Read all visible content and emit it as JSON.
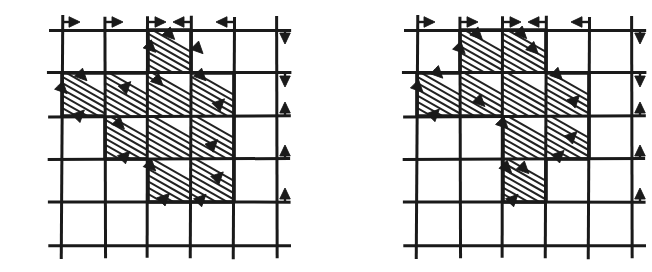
{
  "figure": {
    "type": "grid-diagram-pair",
    "background_color": "#ffffff",
    "ink_color": "#1a1a1a",
    "hatch_color": "#222222",
    "hatch_angle_deg": 45
  },
  "grid": {
    "columns": 5,
    "rows": 5,
    "cell_size": 43,
    "line_width_major": 3,
    "line_width_hatch": 2,
    "overhang": 14
  },
  "diagrams": [
    {
      "id": "left-diagram",
      "name": "left-grid-diagram",
      "origin_x": 62,
      "origin_y": 30,
      "shaded_cells": [
        {
          "row": 1,
          "col": 3
        },
        {
          "row": 2,
          "col": 1
        },
        {
          "row": 2,
          "col": 2
        },
        {
          "row": 2,
          "col": 3
        },
        {
          "row": 2,
          "col": 4
        },
        {
          "row": 3,
          "col": 2
        },
        {
          "row": 3,
          "col": 3
        },
        {
          "row": 3,
          "col": 4
        },
        {
          "row": 4,
          "col": 3
        },
        {
          "row": 4,
          "col": 4
        }
      ],
      "top_arrows": [
        {
          "index": 1,
          "direction": "right",
          "glyph": "→"
        },
        {
          "index": 2,
          "direction": "right",
          "glyph": "→"
        },
        {
          "index": 3,
          "direction": "right",
          "glyph": "→"
        },
        {
          "index": 4,
          "direction": "left",
          "glyph": "←"
        },
        {
          "index": 5,
          "direction": "left",
          "glyph": "←"
        }
      ],
      "right_arrows": [
        {
          "index": 1,
          "direction": "down",
          "glyph": "↓"
        },
        {
          "index": 2,
          "direction": "down",
          "glyph": "↓"
        },
        {
          "index": 3,
          "direction": "up",
          "glyph": "↑"
        },
        {
          "index": 4,
          "direction": "up",
          "glyph": "↑"
        },
        {
          "index": 5,
          "direction": "up",
          "glyph": "↑"
        }
      ],
      "interior_arrows": [
        {
          "row": 1,
          "col": 3,
          "direction": "down-right",
          "x_frac": 0.18,
          "y_frac": 0.52
        },
        {
          "row": 1,
          "col": 3,
          "direction": "down-right",
          "x_frac": 0.62,
          "y_frac": 0.22
        },
        {
          "row": 1,
          "col": 4,
          "direction": "down-right",
          "x_frac": 0.28,
          "y_frac": 0.55
        },
        {
          "row": 2,
          "col": 1,
          "direction": "down-right",
          "x_frac": 0.58,
          "y_frac": 0.18
        },
        {
          "row": 2,
          "col": 1,
          "direction": "down-right",
          "x_frac": 0.12,
          "y_frac": 0.48
        },
        {
          "row": 2,
          "col": 1,
          "direction": "up-right",
          "x_frac": 0.52,
          "y_frac": 0.86
        },
        {
          "row": 2,
          "col": 2,
          "direction": "up-right",
          "x_frac": 0.6,
          "y_frac": 0.2
        },
        {
          "row": 2,
          "col": 3,
          "direction": "down-right",
          "x_frac": 0.35,
          "y_frac": 0.3
        },
        {
          "row": 2,
          "col": 4,
          "direction": "down-right",
          "x_frac": 0.35,
          "y_frac": 0.18
        },
        {
          "row": 2,
          "col": 4,
          "direction": "up-right",
          "x_frac": 0.78,
          "y_frac": 0.6
        },
        {
          "row": 3,
          "col": 2,
          "direction": "down-right",
          "x_frac": 0.45,
          "y_frac": 0.3
        },
        {
          "row": 3,
          "col": 2,
          "direction": "up-right",
          "x_frac": 0.58,
          "y_frac": 0.82
        },
        {
          "row": 3,
          "col": 4,
          "direction": "up-right",
          "x_frac": 0.62,
          "y_frac": 0.55
        },
        {
          "row": 4,
          "col": 3,
          "direction": "down-right",
          "x_frac": 0.18,
          "y_frac": 0.28
        },
        {
          "row": 4,
          "col": 3,
          "direction": "up-right",
          "x_frac": 0.5,
          "y_frac": 0.8
        },
        {
          "row": 4,
          "col": 4,
          "direction": "up-right",
          "x_frac": 0.35,
          "y_frac": 0.82
        },
        {
          "row": 4,
          "col": 4,
          "direction": "up-right",
          "x_frac": 0.75,
          "y_frac": 0.3
        }
      ]
    },
    {
      "id": "right-diagram",
      "name": "right-grid-diagram",
      "origin_x": 417,
      "origin_y": 30,
      "shaded_cells": [
        {
          "row": 1,
          "col": 2
        },
        {
          "row": 1,
          "col": 3
        },
        {
          "row": 2,
          "col": 1
        },
        {
          "row": 2,
          "col": 2
        },
        {
          "row": 2,
          "col": 3
        },
        {
          "row": 2,
          "col": 4
        },
        {
          "row": 3,
          "col": 3
        },
        {
          "row": 3,
          "col": 4
        },
        {
          "row": 4,
          "col": 3
        }
      ],
      "top_arrows": [
        {
          "index": 1,
          "direction": "right",
          "glyph": "→"
        },
        {
          "index": 2,
          "direction": "right",
          "glyph": "→"
        },
        {
          "index": 3,
          "direction": "right",
          "glyph": "→"
        },
        {
          "index": 4,
          "direction": "left",
          "glyph": "←"
        },
        {
          "index": 5,
          "direction": "left",
          "glyph": "←"
        }
      ],
      "right_arrows": [
        {
          "index": 1,
          "direction": "down",
          "glyph": "↓"
        },
        {
          "index": 2,
          "direction": "down",
          "glyph": "↓"
        },
        {
          "index": 3,
          "direction": "up",
          "glyph": "↑"
        },
        {
          "index": 4,
          "direction": "up",
          "glyph": "↑"
        },
        {
          "index": 5,
          "direction": "up",
          "glyph": "↑"
        }
      ],
      "interior_arrows": [
        {
          "row": 1,
          "col": 2,
          "direction": "down-right",
          "x_frac": 0.52,
          "y_frac": 0.22
        },
        {
          "row": 1,
          "col": 2,
          "direction": "down-right",
          "x_frac": 0.12,
          "y_frac": 0.55
        },
        {
          "row": 1,
          "col": 3,
          "direction": "down-right",
          "x_frac": 0.55,
          "y_frac": 0.2
        },
        {
          "row": 1,
          "col": 3,
          "direction": "down-right",
          "x_frac": 0.82,
          "y_frac": 0.56
        },
        {
          "row": 2,
          "col": 1,
          "direction": "down-right",
          "x_frac": 0.6,
          "y_frac": 0.12
        },
        {
          "row": 2,
          "col": 1,
          "direction": "down-right",
          "x_frac": 0.14,
          "y_frac": 0.45
        },
        {
          "row": 2,
          "col": 1,
          "direction": "up-right",
          "x_frac": 0.52,
          "y_frac": 0.84
        },
        {
          "row": 2,
          "col": 2,
          "direction": "down-right",
          "x_frac": 0.58,
          "y_frac": 0.78
        },
        {
          "row": 2,
          "col": 4,
          "direction": "down-right",
          "x_frac": 0.38,
          "y_frac": 0.16
        },
        {
          "row": 2,
          "col": 4,
          "direction": "up-right",
          "x_frac": 0.78,
          "y_frac": 0.52
        },
        {
          "row": 3,
          "col": 3,
          "direction": "down-right",
          "x_frac": 0.12,
          "y_frac": 0.3
        },
        {
          "row": 3,
          "col": 4,
          "direction": "up-right",
          "x_frac": 0.72,
          "y_frac": 0.36
        },
        {
          "row": 3,
          "col": 4,
          "direction": "up-right",
          "x_frac": 0.42,
          "y_frac": 0.8
        },
        {
          "row": 4,
          "col": 3,
          "direction": "down-right",
          "x_frac": 0.2,
          "y_frac": 0.32
        },
        {
          "row": 4,
          "col": 3,
          "direction": "down-right",
          "x_frac": 0.6,
          "y_frac": 0.34
        },
        {
          "row": 4,
          "col": 3,
          "direction": "up-right",
          "x_frac": 0.35,
          "y_frac": 0.82
        }
      ]
    }
  ]
}
